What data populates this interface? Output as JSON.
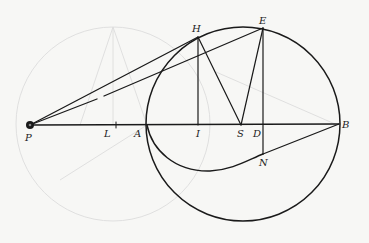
{
  "diagram": {
    "title": "",
    "colors": {
      "ink": "#1a1a1a",
      "faint": "#dcdcdc",
      "background": "#f7f7f5"
    },
    "points": {
      "P": {
        "label": "P",
        "x": 30,
        "y": 125
      },
      "L": {
        "label": "L",
        "x": 116,
        "y": 125
      },
      "A": {
        "label": "A",
        "x": 147,
        "y": 125
      },
      "I": {
        "label": "I",
        "x": 198,
        "y": 125
      },
      "S": {
        "label": "S",
        "x": 241,
        "y": 125
      },
      "D": {
        "label": "D",
        "x": 263,
        "y": 125
      },
      "B": {
        "label": "B",
        "x": 339,
        "y": 124
      },
      "H": {
        "label": "H",
        "x": 198,
        "y": 37
      },
      "E": {
        "label": "E",
        "x": 263,
        "y": 28
      },
      "N": {
        "label": "N",
        "x": 263,
        "y": 154
      }
    },
    "labels": [
      "P",
      "L",
      "A",
      "I",
      "S",
      "D",
      "B",
      "H",
      "E",
      "N"
    ],
    "main_circle": {
      "cx": 243,
      "cy": 124,
      "r": 97
    },
    "faint_circle": {
      "cx": 113,
      "cy": 124,
      "r": 97
    },
    "segments": [
      "P-B",
      "P-H",
      "P-E",
      "H-I",
      "H-S",
      "S-E",
      "E-N",
      "N-B"
    ],
    "curves": [
      "A-N conic arc (lower)"
    ]
  }
}
